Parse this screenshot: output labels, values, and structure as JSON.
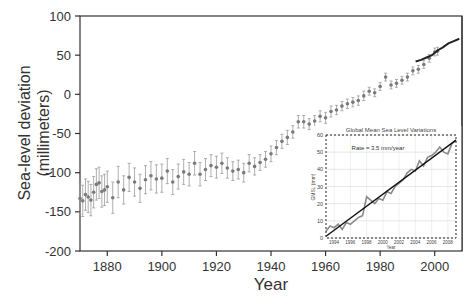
{
  "chart_data": [
    {
      "id": "main",
      "type": "scatter",
      "title": "",
      "xlabel": "Year",
      "ylabel": "Sea-level deviation",
      "ylabel_sub": "(millimeters)",
      "xlim": [
        1870,
        2010
      ],
      "ylim": [
        -200,
        100
      ],
      "xticks": [
        1880,
        1900,
        1920,
        1940,
        1960,
        1980,
        2000
      ],
      "yticks": [
        100,
        50,
        0,
        -50,
        -100,
        -150,
        -200
      ],
      "grid": false,
      "series": [
        {
          "name": "Tide-gauge reconstruction",
          "style": "points-with-error-bars",
          "color": "#7a7a7a",
          "x": [
            1870,
            1871,
            1872,
            1873,
            1874,
            1875,
            1876,
            1877,
            1878,
            1879,
            1880,
            1882,
            1884,
            1886,
            1888,
            1890,
            1892,
            1894,
            1896,
            1898,
            1900,
            1902,
            1904,
            1906,
            1908,
            1910,
            1912,
            1914,
            1916,
            1918,
            1920,
            1922,
            1924,
            1926,
            1928,
            1930,
            1932,
            1934,
            1936,
            1938,
            1940,
            1942,
            1944,
            1946,
            1948,
            1950,
            1952,
            1954,
            1956,
            1958,
            1960,
            1962,
            1964,
            1966,
            1968,
            1970,
            1972,
            1974,
            1976,
            1978,
            1980,
            1982,
            1984,
            1986,
            1988,
            1990,
            1992,
            1994,
            1996,
            1998,
            2000,
            2001
          ],
          "values": [
            -133,
            -136,
            -128,
            -131,
            -135,
            -125,
            -115,
            -113,
            -124,
            -122,
            -118,
            -132,
            -112,
            -122,
            -106,
            -112,
            -120,
            -109,
            -104,
            -108,
            -107,
            -98,
            -112,
            -105,
            -99,
            -102,
            -88,
            -102,
            -96,
            -91,
            -93,
            -88,
            -94,
            -98,
            -96,
            -100,
            -88,
            -92,
            -87,
            -83,
            -76,
            -68,
            -60,
            -55,
            -48,
            -35,
            -35,
            -38,
            -34,
            -28,
            -30,
            -22,
            -20,
            -15,
            -12,
            -10,
            -8,
            -2,
            4,
            2,
            10,
            22,
            12,
            14,
            18,
            22,
            30,
            32,
            38,
            46,
            54,
            55
          ],
          "errors": [
            20,
            20,
            20,
            20,
            20,
            20,
            20,
            20,
            20,
            20,
            20,
            20,
            20,
            18,
            18,
            18,
            18,
            18,
            18,
            18,
            18,
            16,
            16,
            16,
            16,
            15,
            15,
            15,
            14,
            14,
            14,
            13,
            13,
            12,
            12,
            12,
            11,
            11,
            10,
            10,
            10,
            9,
            9,
            9,
            8,
            8,
            8,
            7,
            7,
            7,
            7,
            7,
            6,
            6,
            6,
            6,
            6,
            6,
            5,
            5,
            5,
            5,
            5,
            5,
            5,
            5,
            5,
            5,
            5,
            5,
            5,
            5
          ]
        },
        {
          "name": "Satellite altimetry",
          "style": "line",
          "color": "#222222",
          "x": [
            1993,
            1995,
            1997,
            1999,
            2001,
            2003,
            2005,
            2007,
            2009
          ],
          "values": [
            42,
            44,
            47,
            50,
            56,
            60,
            65,
            68,
            71
          ]
        }
      ]
    },
    {
      "id": "inset",
      "type": "line",
      "title": "Global Mean Sea Level Variations",
      "annotation": "Rate = 3.5 mm/year",
      "xlabel": "Year",
      "ylabel": "GMSL (mm)",
      "xlim": [
        1993,
        2009
      ],
      "ylim": [
        0,
        60
      ],
      "xticks": [
        1994,
        1996,
        1998,
        2000,
        2002,
        2004,
        2006,
        2008
      ],
      "yticks": [
        0,
        10,
        20,
        30,
        40,
        50,
        60
      ],
      "grid": true,
      "series": [
        {
          "name": "GMSL",
          "color": "#8a8a8a",
          "x": [
            1993.0,
            1993.5,
            1994.0,
            1994.5,
            1995.0,
            1995.5,
            1996.0,
            1996.5,
            1997.0,
            1997.5,
            1998.0,
            1998.5,
            1999.0,
            1999.5,
            2000.0,
            2000.5,
            2001.0,
            2001.5,
            2002.0,
            2002.5,
            2003.0,
            2003.5,
            2004.0,
            2004.5,
            2005.0,
            2005.5,
            2006.0,
            2006.5,
            2007.0,
            2007.5,
            2008.0,
            2008.5,
            2009.0
          ],
          "values": [
            4,
            7,
            6,
            8,
            5,
            9,
            8,
            10,
            12,
            13,
            24,
            22,
            20,
            23,
            22,
            27,
            26,
            30,
            32,
            34,
            38,
            40,
            39,
            45,
            42,
            47,
            48,
            50,
            53,
            50,
            49,
            55,
            57
          ]
        },
        {
          "name": "Trend (3.5 mm/yr)",
          "color": "#111111",
          "x": [
            1993,
            2009
          ],
          "values": [
            1,
            57
          ]
        }
      ]
    }
  ]
}
